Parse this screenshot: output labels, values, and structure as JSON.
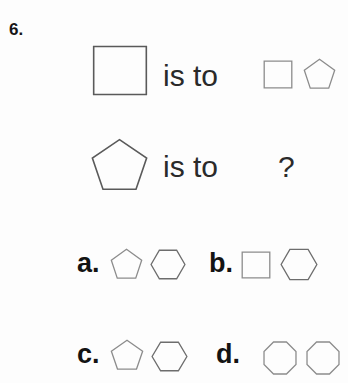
{
  "question": {
    "number": "6.",
    "relation_label": "is to",
    "unknown_marker": "?"
  },
  "stem": {
    "row1": {
      "left_shape": "square",
      "relation": "is to",
      "right_shapes": [
        "square",
        "pentagon"
      ]
    },
    "row2": {
      "left_shape": "pentagon",
      "relation": "is to",
      "right_shapes": [
        "?"
      ]
    }
  },
  "options": [
    {
      "letter": "a.",
      "shapes": [
        "pentagon",
        "hexagon"
      ]
    },
    {
      "letter": "b.",
      "shapes": [
        "square",
        "hexagon"
      ]
    },
    {
      "letter": "c.",
      "shapes": [
        "pentagon",
        "hexagon"
      ]
    },
    {
      "letter": "d.",
      "shapes": [
        "octagon",
        "octagon"
      ]
    }
  ],
  "colors": {
    "page_background": "#fdfdfd",
    "text": "#242424",
    "shape_stroke": "#6d6d6d",
    "shape_stroke_light": "#8c8c8c"
  }
}
